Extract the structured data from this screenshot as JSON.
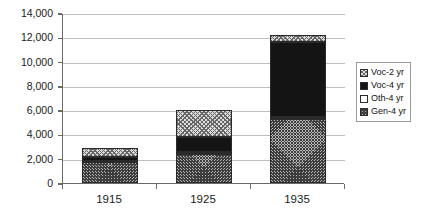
{
  "chart_data": {
    "type": "bar",
    "stacked": true,
    "title": "",
    "subtitle": "",
    "xlabel": "",
    "ylabel": "",
    "categories": [
      "1915",
      "1925",
      "1935"
    ],
    "ylim": [
      0,
      14000
    ],
    "ytick_values": [
      0,
      2000,
      4000,
      6000,
      8000,
      10000,
      12000,
      14000
    ],
    "ytick_labels": [
      "0",
      "2,000",
      "4,000",
      "6,000",
      "8,000",
      "10,000",
      "12,000",
      "14,000"
    ],
    "grid": true,
    "grid_axis": "y",
    "legend_position": "right",
    "series": [
      {
        "name": "Gen-4 yr",
        "pattern": "crosshatch-dense",
        "color": "#b9b9b9",
        "values": [
          1700,
          2400,
          5300
        ]
      },
      {
        "name": "Oth-4 yr",
        "pattern": "solid-white",
        "color": "#ffffff",
        "values": [
          150,
          150,
          100
        ]
      },
      {
        "name": "Voc-4 yr",
        "pattern": "solid-black",
        "color": "#141414",
        "values": [
          300,
          1200,
          6200
        ]
      },
      {
        "name": "Voc-2 yr",
        "pattern": "checker-light",
        "color": "#dcdcdc",
        "values": [
          750,
          2300,
          600
        ]
      }
    ],
    "stack_order_bottom_to_top": [
      "Gen-4 yr",
      "Oth-4 yr",
      "Voc-4 yr",
      "Voc-2 yr"
    ],
    "totals": [
      2900,
      6050,
      12200
    ]
  },
  "legend": {
    "items": [
      {
        "label": "Voc-2 yr",
        "swatch": "checker-light"
      },
      {
        "label": "Voc-4 yr",
        "swatch": "solid-black"
      },
      {
        "label": "Oth-4 yr",
        "swatch": "solid-white"
      },
      {
        "label": "Gen-4 yr",
        "swatch": "crosshatch-dense"
      }
    ]
  }
}
